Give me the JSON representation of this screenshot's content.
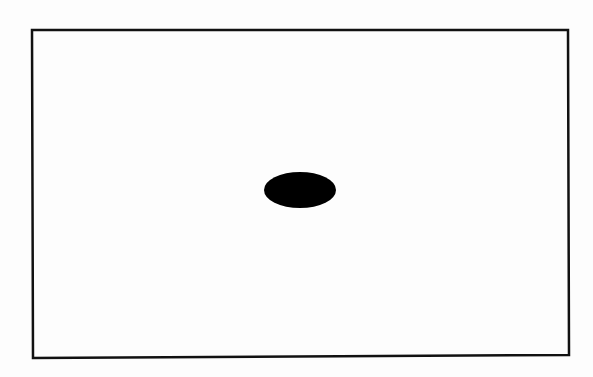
{
  "figure": {
    "type": "diagram",
    "colors": {
      "background": "#fdfdfd",
      "frame_stroke": "#111111",
      "ellipse_fill": "#000000"
    },
    "frame": {
      "x1": 32,
      "y1": 30,
      "x2": 568,
      "y2": 30,
      "x3": 569,
      "y3": 355,
      "x4": 33,
      "y4": 358,
      "stroke_width": 2.5
    },
    "ellipse": {
      "cx": 300,
      "cy": 190,
      "rx": 36,
      "ry": 18
    }
  }
}
